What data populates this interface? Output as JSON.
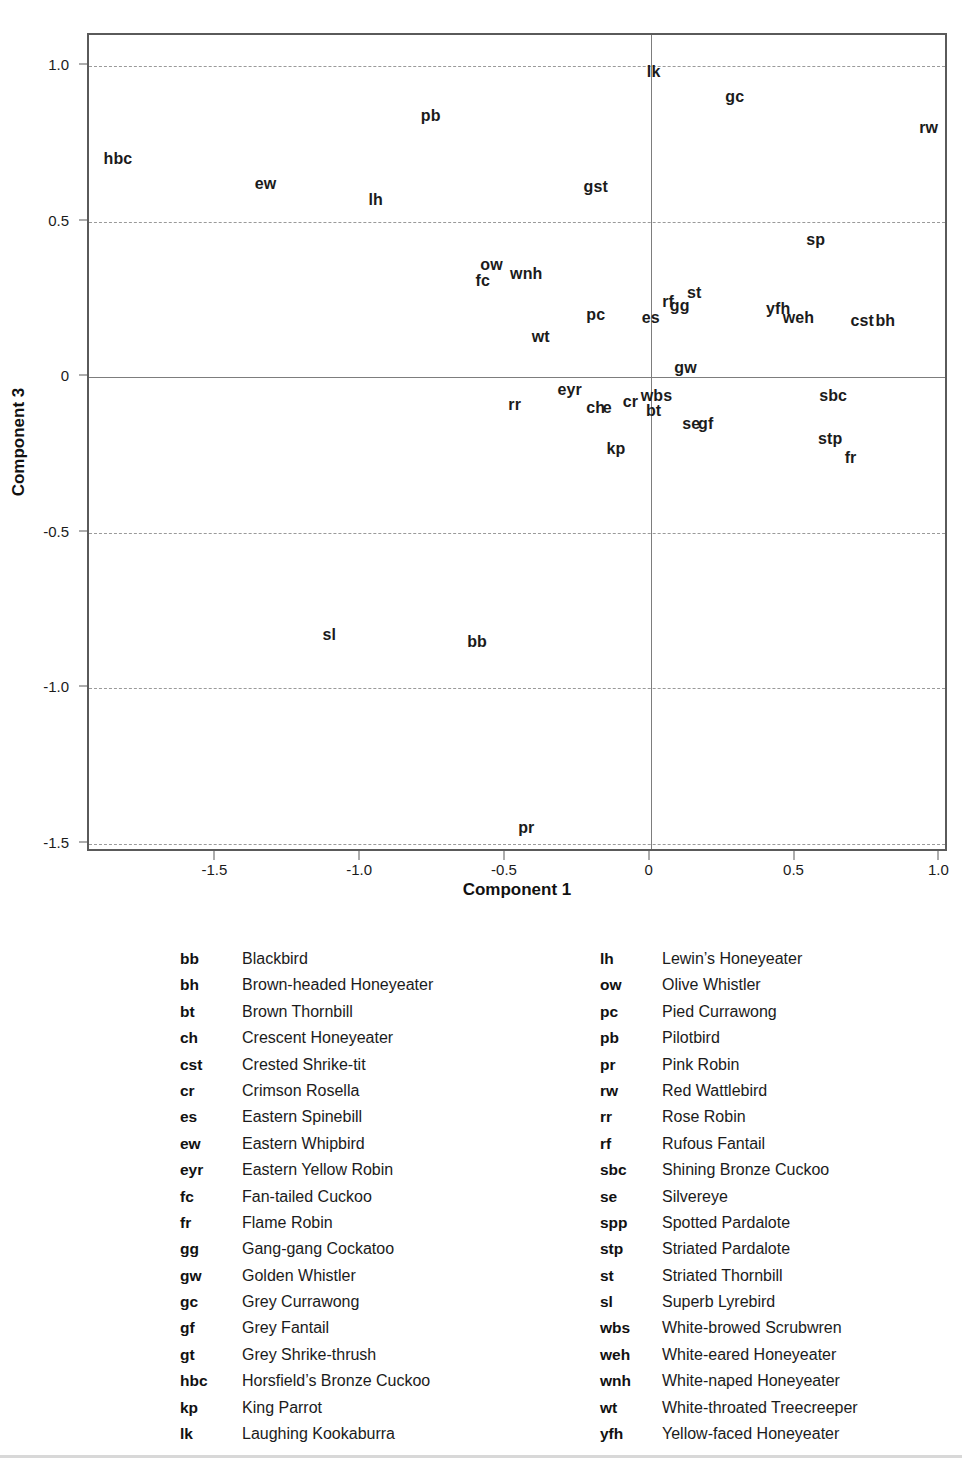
{
  "chart_data": {
    "type": "scatter",
    "title": "",
    "xlabel": "Component 1",
    "ylabel": "Component 3",
    "xlim": [
      -1.94,
      1.03
    ],
    "ylim": [
      -1.53,
      1.1
    ],
    "xticks": [
      "-1.5",
      "-1.0",
      "-0.5",
      "0",
      "0.5",
      "1.0"
    ],
    "xtickvals": [
      -1.5,
      -1.0,
      -0.5,
      0,
      0.5,
      1.0
    ],
    "yticks": [
      "1.0",
      "0.5",
      "0",
      "-0.5",
      "-1.0",
      "-1.5"
    ],
    "ytickvals": [
      1.0,
      0.5,
      0,
      -0.5,
      -1.0,
      -1.5
    ],
    "grid": "dashed horizontal gridlines at y ticks; solid reference lines at x=0 and y=0",
    "legend_position": "below plot, two columns",
    "marker_style": "text-label only (species code), no point markers",
    "points": [
      {
        "label": "lk",
        "x": 0.01,
        "y": 0.98
      },
      {
        "label": "gc",
        "x": 0.29,
        "y": 0.9
      },
      {
        "label": "pb",
        "x": -0.76,
        "y": 0.84
      },
      {
        "label": "rw",
        "x": 0.96,
        "y": 0.8
      },
      {
        "label": "hbc",
        "x": -1.84,
        "y": 0.7
      },
      {
        "label": "ew",
        "x": -1.33,
        "y": 0.62
      },
      {
        "label": "gst",
        "x": -0.19,
        "y": 0.61
      },
      {
        "label": "lh",
        "x": -0.95,
        "y": 0.57
      },
      {
        "label": "sp",
        "x": 0.57,
        "y": 0.44
      },
      {
        "label": "ow",
        "x": -0.55,
        "y": 0.36
      },
      {
        "label": "wnh",
        "x": -0.43,
        "y": 0.33
      },
      {
        "label": "fc",
        "x": -0.58,
        "y": 0.31
      },
      {
        "label": "st",
        "x": 0.15,
        "y": 0.27
      },
      {
        "label": "rf",
        "x": 0.06,
        "y": 0.24
      },
      {
        "label": "gg",
        "x": 0.1,
        "y": 0.23
      },
      {
        "label": "yfh",
        "x": 0.44,
        "y": 0.22
      },
      {
        "label": "pc",
        "x": -0.19,
        "y": 0.2
      },
      {
        "label": "es",
        "x": 0.0,
        "y": 0.19
      },
      {
        "label": "weh",
        "x": 0.51,
        "y": 0.19
      },
      {
        "label": "cst",
        "x": 0.73,
        "y": 0.18
      },
      {
        "label": "bh",
        "x": 0.81,
        "y": 0.18
      },
      {
        "label": "wt",
        "x": -0.38,
        "y": 0.13
      },
      {
        "label": "gw",
        "x": 0.12,
        "y": 0.03
      },
      {
        "label": "eyr",
        "x": -0.28,
        "y": -0.04
      },
      {
        "label": "wbs",
        "x": 0.02,
        "y": -0.06
      },
      {
        "label": "sbc",
        "x": 0.63,
        "y": -0.06
      },
      {
        "label": "cr",
        "x": -0.07,
        "y": -0.08
      },
      {
        "label": "rr",
        "x": -0.47,
        "y": -0.09
      },
      {
        "label": "ch",
        "x": -0.19,
        "y": -0.1
      },
      {
        "label": "e",
        "x": -0.15,
        "y": -0.1
      },
      {
        "label": "bt",
        "x": 0.01,
        "y": -0.11
      },
      {
        "label": "se",
        "x": 0.14,
        "y": -0.15
      },
      {
        "label": "gf",
        "x": 0.19,
        "y": -0.15
      },
      {
        "label": "stp",
        "x": 0.62,
        "y": -0.2
      },
      {
        "label": "kp",
        "x": -0.12,
        "y": -0.23
      },
      {
        "label": "fr",
        "x": 0.69,
        "y": -0.26
      },
      {
        "label": "sl",
        "x": -1.11,
        "y": -0.83
      },
      {
        "label": "bb",
        "x": -0.6,
        "y": -0.85
      },
      {
        "label": "pr",
        "x": -0.43,
        "y": -1.45
      }
    ]
  },
  "legend": {
    "left": [
      {
        "code": "bb",
        "name": "Blackbird"
      },
      {
        "code": "bh",
        "name": "Brown-headed Honeyeater"
      },
      {
        "code": "bt",
        "name": "Brown Thornbill"
      },
      {
        "code": "ch",
        "name": "Crescent Honeyeater"
      },
      {
        "code": "cst",
        "name": "Crested Shrike-tit"
      },
      {
        "code": "cr",
        "name": "Crimson Rosella"
      },
      {
        "code": "es",
        "name": "Eastern Spinebill"
      },
      {
        "code": "ew",
        "name": "Eastern Whipbird"
      },
      {
        "code": "eyr",
        "name": "Eastern Yellow Robin"
      },
      {
        "code": "fc",
        "name": "Fan-tailed Cuckoo"
      },
      {
        "code": "fr",
        "name": "Flame Robin"
      },
      {
        "code": "gg",
        "name": "Gang-gang Cockatoo"
      },
      {
        "code": "gw",
        "name": "Golden Whistler"
      },
      {
        "code": "gc",
        "name": "Grey Currawong"
      },
      {
        "code": "gf",
        "name": "Grey Fantail"
      },
      {
        "code": "gt",
        "name": "Grey Shrike-thrush"
      },
      {
        "code": "hbc",
        "name": "Horsfield’s Bronze Cuckoo"
      },
      {
        "code": "kp",
        "name": "King Parrot"
      },
      {
        "code": "lk",
        "name": "Laughing Kookaburra"
      }
    ],
    "right": [
      {
        "code": "lh",
        "name": "Lewin’s Honeyeater"
      },
      {
        "code": "ow",
        "name": "Olive Whistler"
      },
      {
        "code": "pc",
        "name": "Pied Currawong"
      },
      {
        "code": "pb",
        "name": "Pilotbird"
      },
      {
        "code": "pr",
        "name": "Pink Robin"
      },
      {
        "code": "rw",
        "name": "Red Wattlebird"
      },
      {
        "code": "rr",
        "name": "Rose Robin"
      },
      {
        "code": "rf",
        "name": "Rufous Fantail"
      },
      {
        "code": "sbc",
        "name": "Shining Bronze Cuckoo"
      },
      {
        "code": "se",
        "name": "Silvereye"
      },
      {
        "code": "spp",
        "name": "Spotted Pardalote"
      },
      {
        "code": "stp",
        "name": "Striated Pardalote"
      },
      {
        "code": "st",
        "name": "Striated Thornbill"
      },
      {
        "code": "sl",
        "name": "Superb Lyrebird"
      },
      {
        "code": "wbs",
        "name": "White-browed Scrubwren"
      },
      {
        "code": "weh",
        "name": "White-eared Honeyeater"
      },
      {
        "code": "wnh",
        "name": "White-naped Honeyeater"
      },
      {
        "code": "wt",
        "name": "White-throated Treecreeper"
      },
      {
        "code": "yfh",
        "name": "Yellow-faced Honeyeater"
      }
    ]
  },
  "colors": {
    "frame": "#5a5a5a",
    "grid": "#9a9a9a",
    "text": "#1b1b1b",
    "background": "#ffffff"
  }
}
